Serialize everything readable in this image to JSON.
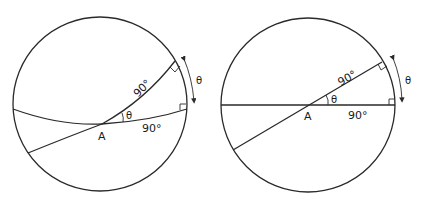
{
  "figure": {
    "stroke_color": "#2a2a2a",
    "panels": [
      {
        "id": "sphere-view",
        "labels": {
          "point": "A",
          "angle_at_A": "θ",
          "arc_upper": "90°",
          "arc_lower": "90°",
          "arc_rim": "θ"
        }
      },
      {
        "id": "flat-view",
        "labels": {
          "point": "A",
          "angle_at_A": "θ",
          "arc_upper": "90°",
          "arc_lower": "90°",
          "arc_rim": "θ"
        }
      }
    ]
  }
}
